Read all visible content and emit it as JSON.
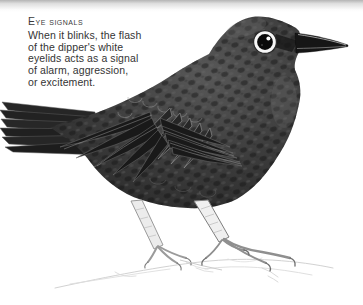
{
  "page": {
    "background": "#ffffff",
    "top_band_color": "#b4b4b4"
  },
  "caption": {
    "heading": "Eye signals",
    "lines": [
      "When it blinks, the flash",
      "of the dipper's white",
      "eyelids acts as a signal",
      "of alarm, aggression,",
      "or excitement."
    ]
  },
  "illustration": {
    "subject": "dipper bird, side view facing right, standing on lightly sketched rock",
    "style": "black-and-white stipple engraving",
    "colors": {
      "plumage_dark": "#1c1c1c",
      "plumage_mid": "#3d3d3d",
      "eye_ring_white": "#f7f7f7",
      "eye_black": "#0a0a0a",
      "leg_light": "#ededed",
      "rock_sketch": "#d4d4d4",
      "text_ink": "#363636"
    }
  }
}
